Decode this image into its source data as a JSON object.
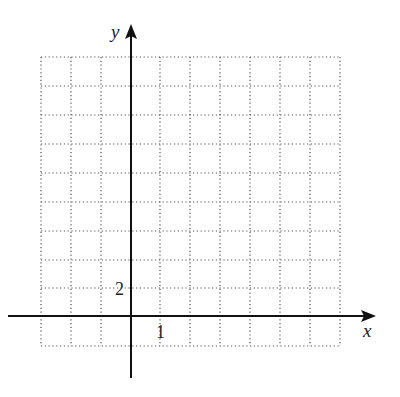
{
  "diagram": {
    "type": "coordinate-grid",
    "axes": {
      "x_label": "x",
      "y_label": "y"
    },
    "tick_labels": {
      "x_unit": "1",
      "y_unit": "2"
    },
    "grid": {
      "columns": 10,
      "rows": 10,
      "columns_left_of_y_axis": 3,
      "rows_below_x_axis": 1,
      "x_scale_per_cell": 1,
      "y_scale_per_cell": 2,
      "style": "dotted"
    },
    "colors": {
      "axis": "#111111",
      "grid": "#555555",
      "background": "#ffffff"
    }
  }
}
